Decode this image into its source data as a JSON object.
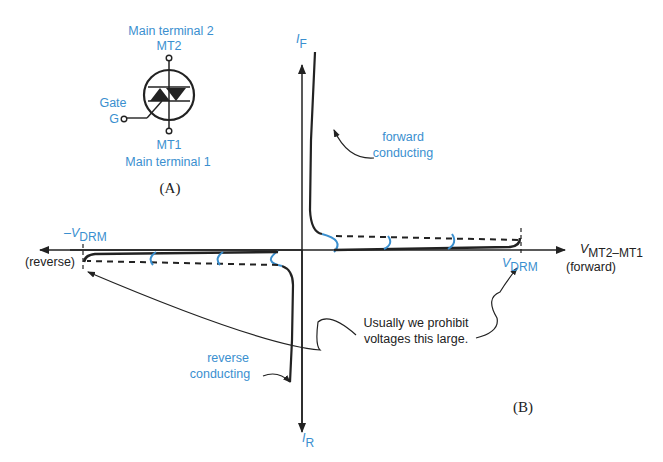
{
  "symbol": {
    "mt2_name": "Main terminal 2",
    "mt2_label": "MT2",
    "gate_name": "Gate",
    "gate_label": "G",
    "mt1_label": "MT1",
    "mt1_name": "Main terminal 1",
    "caption": "(A)"
  },
  "graph": {
    "y_pos_label": "I",
    "y_pos_sub": "F",
    "y_neg_label": "I",
    "y_neg_sub": "R",
    "x_label": "V",
    "x_sub": "MT2–MT1",
    "x_pos_note": "(forward)",
    "x_neg_note": "(reverse)",
    "vdrm_pos": "V",
    "vdrm_pos_sub": "DRM",
    "vdrm_neg": "–V",
    "vdrm_neg_sub": "DRM",
    "forward_line1": "forward",
    "forward_line2": "conducting",
    "reverse_line1": "reverse",
    "reverse_line2": "conducting",
    "note_line1": "Usually we prohibit",
    "note_line2": "voltages this large.",
    "caption": "(B)"
  },
  "colors": {
    "accent_blue": "#3a8fcf",
    "line": "#222222"
  }
}
